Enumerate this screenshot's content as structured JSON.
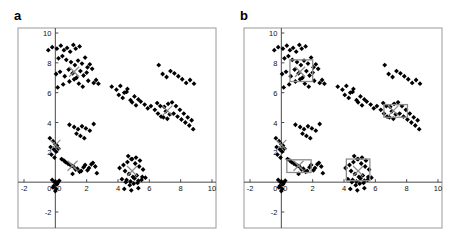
{
  "figure": {
    "panels": [
      {
        "key": "a",
        "label": "a",
        "has_boxes": false
      },
      {
        "key": "b",
        "label": "b",
        "has_boxes": true
      }
    ]
  },
  "colors": {
    "point": "#000000",
    "centroid": "#8c8c8c",
    "box": "#8c8c8c",
    "frame": "#9a9a9a",
    "axis": "#4a4a4a",
    "tick_text": "#111111",
    "background": "#ffffff"
  },
  "chart_data": {
    "type": "scatter",
    "title": "",
    "xlabel": "",
    "ylabel": "",
    "xlim": [
      -2,
      10
    ],
    "ylim": [
      -2,
      10
    ],
    "xticks": [
      -2,
      0,
      2,
      4,
      6,
      8,
      10
    ],
    "yticks": [
      -2,
      0,
      2,
      4,
      6,
      8,
      10
    ],
    "xtick_labels": [
      "-2",
      "0",
      "2",
      "4",
      "6",
      "8",
      "10"
    ],
    "ytick_labels": [
      "-2",
      "0",
      "2",
      "4",
      "6",
      "8",
      "10"
    ],
    "grid": false,
    "legend": null,
    "marker": "diamond",
    "series": [
      {
        "name": "data points",
        "color": "#000000",
        "x": [
          -0.45,
          -0.2,
          0.1,
          0.35,
          0.55,
          0.75,
          0.95,
          1.15,
          1.3,
          1.55,
          0.2,
          0.45,
          0.7,
          1.0,
          1.25,
          1.45,
          1.7,
          1.9,
          2.05,
          2.2,
          0.05,
          0.3,
          0.6,
          0.85,
          1.1,
          1.35,
          1.6,
          1.8,
          2.0,
          2.35,
          0.15,
          0.5,
          0.9,
          1.2,
          1.5,
          1.75,
          2.1,
          2.45,
          2.6,
          2.75,
          3.6,
          3.9,
          4.15,
          4.4,
          4.6,
          4.05,
          4.3,
          4.55,
          4.8,
          5.05,
          5.3,
          4.9,
          5.15,
          5.45,
          5.7,
          5.9,
          6.1,
          6.35,
          6.55,
          6.75,
          6.5,
          6.7,
          6.95,
          7.2,
          7.45,
          7.7,
          7.95,
          8.2,
          8.45,
          8.7,
          7.05,
          7.3,
          7.55,
          7.8,
          8.05,
          8.3,
          8.55,
          8.8,
          6.9,
          7.15,
          6.6,
          6.85,
          7.1,
          7.35,
          7.6,
          7.85,
          8.1,
          8.35,
          8.6,
          8.85,
          0.9,
          1.2,
          1.45,
          1.7,
          1.95,
          2.2,
          2.45,
          1.35,
          1.6,
          1.85,
          -0.35,
          -0.15,
          0.0,
          -0.3,
          -0.1,
          0.05,
          -0.25,
          -0.05,
          0.1,
          0.2,
          -0.2,
          0.0,
          0.15,
          -0.1,
          0.05,
          0.25,
          -0.05,
          0.1,
          0.0,
          -0.15,
          0.4,
          0.65,
          0.9,
          1.15,
          1.4,
          1.65,
          1.9,
          2.15,
          2.4,
          2.65,
          0.55,
          0.8,
          1.05,
          1.3,
          1.55,
          1.8,
          2.05,
          2.3,
          2.55,
          1.1,
          4.1,
          4.35,
          4.6,
          4.85,
          5.1,
          5.35,
          5.6,
          4.45,
          4.7,
          4.95,
          5.2,
          4.55,
          4.8,
          5.05,
          5.3,
          5.55,
          4.25,
          4.5,
          4.75,
          5.0,
          5.25,
          5.5,
          5.75,
          4.65,
          4.9,
          5.15,
          5.4,
          4.4,
          4.85,
          5.3
        ],
        "y": [
          8.85,
          9.05,
          8.95,
          9.15,
          8.85,
          9.0,
          8.75,
          9.2,
          8.95,
          9.1,
          8.3,
          8.45,
          8.2,
          8.05,
          7.85,
          8.15,
          7.95,
          8.35,
          7.7,
          7.9,
          7.25,
          7.4,
          7.1,
          7.55,
          7.3,
          7.0,
          7.45,
          7.15,
          7.35,
          7.6,
          6.35,
          6.55,
          6.75,
          6.9,
          6.6,
          6.4,
          6.8,
          6.65,
          6.85,
          6.6,
          6.4,
          6.2,
          6.45,
          6.0,
          6.25,
          5.85,
          5.65,
          6.05,
          5.5,
          5.75,
          5.55,
          5.35,
          5.15,
          5.4,
          5.2,
          4.95,
          5.1,
          4.85,
          4.6,
          4.4,
          5.3,
          5.1,
          5.05,
          5.25,
          5.35,
          5.1,
          4.85,
          4.6,
          4.35,
          4.15,
          4.75,
          4.55,
          4.6,
          4.4,
          4.2,
          4.0,
          3.8,
          3.55,
          4.35,
          4.25,
          7.85,
          7.25,
          7.05,
          7.45,
          7.3,
          7.1,
          6.9,
          6.65,
          6.85,
          6.6,
          3.85,
          3.7,
          3.55,
          3.75,
          3.6,
          3.45,
          3.9,
          3.25,
          3.1,
          2.95,
          2.95,
          2.75,
          2.55,
          2.35,
          2.2,
          2.05,
          1.85,
          1.65,
          2.45,
          2.25,
          0.15,
          0.05,
          -0.05,
          -0.25,
          -0.45,
          0.1,
          0.0,
          -0.15,
          -0.6,
          -0.35,
          1.55,
          1.35,
          1.2,
          1.05,
          0.9,
          0.75,
          1.15,
          0.95,
          1.3,
          0.6,
          1.45,
          1.25,
          1.1,
          0.85,
          0.7,
          1.0,
          0.8,
          1.2,
          1.05,
          0.55,
          0.95,
          1.15,
          1.35,
          1.55,
          1.25,
          1.05,
          0.85,
          0.75,
          0.55,
          0.35,
          0.45,
          0.15,
          0.05,
          0.25,
          0.1,
          0.35,
          0.2,
          0.0,
          -0.2,
          -0.1,
          -0.05,
          0.15,
          0.3,
          1.75,
          1.55,
          1.65,
          1.45,
          -0.45,
          -0.55,
          -0.4
        ],
        "count": 170
      }
    ],
    "centroids": {
      "name": "cluster centroids",
      "marker": "x",
      "color": "#8c8c8c",
      "points": [
        {
          "x": 1.2,
          "y": 7.4
        },
        {
          "x": 7.15,
          "y": 4.8
        },
        {
          "x": 0.0,
          "y": 2.5
        },
        {
          "x": 1.1,
          "y": 1.1
        },
        {
          "x": 4.9,
          "y": 0.75
        }
      ]
    },
    "boxes": {
      "name": "bounding boxes",
      "color": "#8c8c8c",
      "panel": "b",
      "rects": [
        {
          "x": 0.55,
          "y": 6.75,
          "w": 1.45,
          "h": 1.45
        },
        {
          "x": 6.55,
          "y": 4.35,
          "w": 1.5,
          "h": 0.85
        },
        {
          "x": 0.35,
          "y": 0.65,
          "w": 1.55,
          "h": 0.85
        },
        {
          "x": 4.15,
          "y": 0.1,
          "w": 1.5,
          "h": 1.45
        }
      ]
    }
  }
}
